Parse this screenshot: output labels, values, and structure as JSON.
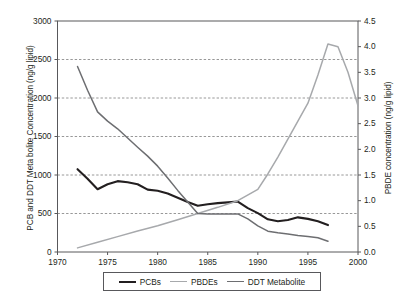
{
  "chart_data": {
    "type": "line",
    "title": "",
    "xlabel": "",
    "ylabel": "PCB and DDT Meta bolite Concentration (ng/g lipid)",
    "y2label": "PBDE concentration (ng/g lipid)",
    "xlim": [
      1970,
      2000
    ],
    "ylim": [
      0,
      3000
    ],
    "y2lim": [
      0.0,
      4.5
    ],
    "grid": true,
    "legend_position": "bottom",
    "xticks": [
      "1970",
      "1975",
      "1980",
      "1985",
      "1990",
      "1995",
      "2000"
    ],
    "xtick_values": [
      1970,
      1975,
      1980,
      1985,
      1990,
      1995,
      2000
    ],
    "yticks": [
      "0",
      "500",
      "1000",
      "1500",
      "2000",
      "2500",
      "3000"
    ],
    "ytick_values": [
      0,
      500,
      1000,
      1500,
      2000,
      2500,
      3000
    ],
    "y2ticks": [
      "0.0",
      "0.5",
      "1.0",
      "1.5",
      "2.0",
      "2.5",
      "3.0",
      "3.5",
      "4.0",
      "4.5"
    ],
    "y2tick_values": [
      0.0,
      0.5,
      1.0,
      1.5,
      2.0,
      2.5,
      3.0,
      3.5,
      4.0,
      4.5
    ],
    "series": [
      {
        "name": "PCBs",
        "axis": "left",
        "color": "#231f20",
        "width": 2.1,
        "x": [
          1972,
          1973,
          1974,
          1975,
          1976,
          1977,
          1978,
          1979,
          1980,
          1981,
          1982,
          1983,
          1984,
          1985,
          1986,
          1987,
          1988,
          1989,
          1990,
          1991,
          1992,
          1993,
          1994,
          1995,
          1996,
          1997
        ],
        "values": [
          1075,
          950,
          815,
          880,
          920,
          905,
          880,
          810,
          795,
          760,
          705,
          650,
          600,
          620,
          635,
          645,
          655,
          570,
          505,
          425,
          400,
          415,
          450,
          430,
          400,
          350
        ]
      },
      {
        "name": "PBDEs",
        "axis": "right",
        "color": "#a7a9ac",
        "width": 1.5,
        "x": [
          1972,
          1974,
          1976,
          1978,
          1980,
          1982,
          1984,
          1986,
          1988,
          1990,
          1991,
          1992,
          1993,
          1994,
          1995,
          1996,
          1997,
          1998,
          1999,
          2000
        ],
        "values": [
          0.08,
          0.19,
          0.3,
          0.41,
          0.51,
          0.63,
          0.75,
          0.87,
          1.0,
          1.22,
          1.52,
          1.85,
          2.2,
          2.55,
          2.9,
          3.45,
          4.05,
          4.0,
          3.5,
          2.85
        ]
      },
      {
        "name": "DDT Metabolite",
        "axis": "left",
        "color": "#6d6e71",
        "width": 1.5,
        "x": [
          1972,
          1973,
          1974,
          1975,
          1976,
          1977,
          1978,
          1979,
          1980,
          1981,
          1982,
          1983,
          1984,
          1985,
          1986,
          1987,
          1988,
          1989,
          1990,
          1991,
          1992,
          1993,
          1994,
          1995,
          1996,
          1997
        ],
        "values": [
          2410,
          2100,
          1820,
          1700,
          1600,
          1480,
          1360,
          1245,
          1115,
          960,
          800,
          650,
          500,
          495,
          495,
          495,
          495,
          430,
          340,
          270,
          250,
          235,
          215,
          200,
          185,
          140
        ]
      }
    ]
  },
  "legend": {
    "items": [
      {
        "label": "PCBs",
        "color": "#231f20",
        "width": 2.4
      },
      {
        "label": "PBDEs",
        "color": "#a7a9ac",
        "width": 1.4
      },
      {
        "label": "DDT Metabolite",
        "color": "#6d6e71",
        "width": 1.6
      }
    ]
  }
}
